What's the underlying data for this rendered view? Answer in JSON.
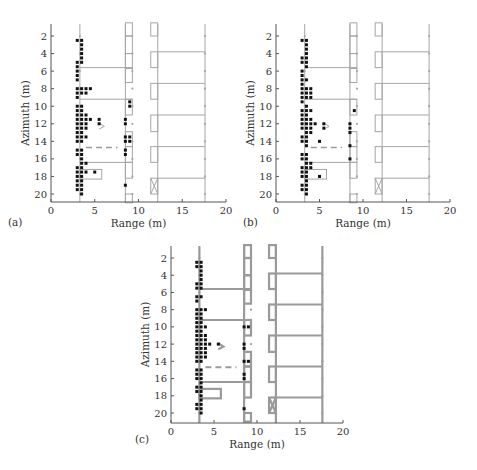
{
  "chart_data": [
    {
      "panel_label": "(a)",
      "type": "scatter",
      "xlabel": "Range (m)",
      "ylabel": "Azimuth (m)",
      "xlim": [
        0,
        20
      ],
      "ylim": [
        21,
        0.5
      ],
      "xticks": [
        0,
        5,
        10,
        15,
        20
      ],
      "yticks": [
        2,
        4,
        6,
        8,
        10,
        12,
        14,
        16,
        18,
        20
      ],
      "grid": false,
      "points": [
        [
          3.0,
          2.5
        ],
        [
          3.5,
          2.5
        ],
        [
          3.5,
          3.0
        ],
        [
          3.5,
          3.5
        ],
        [
          3.5,
          4.0
        ],
        [
          3.5,
          4.5
        ],
        [
          3.5,
          5.0
        ],
        [
          3.0,
          5.0
        ],
        [
          3.0,
          5.5
        ],
        [
          3.0,
          6.0
        ],
        [
          3.0,
          6.5
        ],
        [
          3.0,
          7.0
        ],
        [
          3.0,
          8.0
        ],
        [
          3.5,
          8.0
        ],
        [
          4.0,
          8.0
        ],
        [
          4.5,
          8.0
        ],
        [
          3.0,
          8.5
        ],
        [
          3.5,
          8.5
        ],
        [
          4.0,
          8.5
        ],
        [
          3.0,
          9.0
        ],
        [
          3.0,
          10.0
        ],
        [
          3.5,
          10.0
        ],
        [
          3.0,
          10.5
        ],
        [
          3.5,
          10.5
        ],
        [
          3.0,
          11.0
        ],
        [
          3.5,
          11.0
        ],
        [
          4.0,
          11.0
        ],
        [
          3.0,
          11.5
        ],
        [
          3.5,
          11.5
        ],
        [
          4.0,
          11.5
        ],
        [
          4.5,
          11.5
        ],
        [
          5.5,
          11.5
        ],
        [
          3.0,
          12.0
        ],
        [
          3.5,
          12.0
        ],
        [
          4.0,
          12.0
        ],
        [
          5.5,
          12.0
        ],
        [
          3.0,
          12.5
        ],
        [
          3.5,
          12.5
        ],
        [
          4.0,
          12.5
        ],
        [
          3.0,
          13.0
        ],
        [
          3.5,
          13.0
        ],
        [
          3.0,
          13.5
        ],
        [
          3.5,
          13.5
        ],
        [
          4.0,
          13.5
        ],
        [
          3.0,
          14.0
        ],
        [
          3.5,
          14.0
        ],
        [
          3.0,
          15.0
        ],
        [
          3.5,
          15.0
        ],
        [
          3.0,
          15.5
        ],
        [
          3.5,
          15.5
        ],
        [
          3.5,
          16.0
        ],
        [
          3.5,
          16.5
        ],
        [
          4.0,
          16.5
        ],
        [
          3.0,
          17.0
        ],
        [
          3.5,
          17.0
        ],
        [
          3.0,
          17.5
        ],
        [
          3.5,
          17.5
        ],
        [
          4.0,
          17.5
        ],
        [
          5.0,
          17.5
        ],
        [
          3.0,
          18.0
        ],
        [
          3.5,
          18.0
        ],
        [
          3.0,
          18.5
        ],
        [
          3.5,
          18.5
        ],
        [
          3.0,
          19.0
        ],
        [
          3.5,
          19.0
        ],
        [
          3.0,
          19.5
        ],
        [
          3.5,
          19.5
        ],
        [
          3.5,
          20.0
        ],
        [
          9.0,
          9.5
        ],
        [
          9.0,
          10.0
        ],
        [
          8.5,
          11.5
        ],
        [
          8.5,
          12.0
        ],
        [
          8.5,
          13.5
        ],
        [
          9.0,
          13.5
        ],
        [
          8.5,
          14.0
        ],
        [
          9.0,
          14.0
        ],
        [
          8.5,
          15.0
        ],
        [
          8.5,
          15.5
        ],
        [
          8.5,
          19.0
        ]
      ],
      "annotations": {
        "dashed_line": {
          "x": [
            4.0,
            7.6
          ],
          "y": 14.7
        }
      }
    },
    {
      "panel_label": "(b)",
      "type": "scatter",
      "xlabel": "Range (m)",
      "ylabel": "Azimuth (m)",
      "xlim": [
        0,
        20
      ],
      "ylim": [
        21,
        0.5
      ],
      "xticks": [
        0,
        5,
        10,
        15,
        20
      ],
      "yticks": [
        2,
        4,
        6,
        8,
        10,
        12,
        14,
        16,
        18,
        20
      ],
      "grid": false,
      "points": [
        [
          3.0,
          2.5
        ],
        [
          3.5,
          2.5
        ],
        [
          3.5,
          3.0
        ],
        [
          3.5,
          3.5
        ],
        [
          3.5,
          4.0
        ],
        [
          3.0,
          4.5
        ],
        [
          3.5,
          4.5
        ],
        [
          3.0,
          5.0
        ],
        [
          3.5,
          5.0
        ],
        [
          3.5,
          5.5
        ],
        [
          3.0,
          6.0
        ],
        [
          3.0,
          6.5
        ],
        [
          3.0,
          7.0
        ],
        [
          3.5,
          7.0
        ],
        [
          3.0,
          7.5
        ],
        [
          3.0,
          8.0
        ],
        [
          3.5,
          8.0
        ],
        [
          4.0,
          8.0
        ],
        [
          3.0,
          8.5
        ],
        [
          3.5,
          8.5
        ],
        [
          4.0,
          8.5
        ],
        [
          3.0,
          9.0
        ],
        [
          3.5,
          9.0
        ],
        [
          4.0,
          9.0
        ],
        [
          3.0,
          9.5
        ],
        [
          3.5,
          10.0
        ],
        [
          3.0,
          10.5
        ],
        [
          3.5,
          10.5
        ],
        [
          4.0,
          10.5
        ],
        [
          3.0,
          11.0
        ],
        [
          3.5,
          11.0
        ],
        [
          3.0,
          11.5
        ],
        [
          3.5,
          11.5
        ],
        [
          4.0,
          11.5
        ],
        [
          3.0,
          12.0
        ],
        [
          3.5,
          12.0
        ],
        [
          4.0,
          12.0
        ],
        [
          4.5,
          12.0
        ],
        [
          5.5,
          12.0
        ],
        [
          3.0,
          12.5
        ],
        [
          3.5,
          12.5
        ],
        [
          4.0,
          12.5
        ],
        [
          5.5,
          12.5
        ],
        [
          3.5,
          13.0
        ],
        [
          4.0,
          13.0
        ],
        [
          3.0,
          13.5
        ],
        [
          3.5,
          13.5
        ],
        [
          3.0,
          14.0
        ],
        [
          3.5,
          14.0
        ],
        [
          5.0,
          14.0
        ],
        [
          3.5,
          14.5
        ],
        [
          3.0,
          15.5
        ],
        [
          3.5,
          15.5
        ],
        [
          3.0,
          16.0
        ],
        [
          3.5,
          16.0
        ],
        [
          3.5,
          16.5
        ],
        [
          4.0,
          16.5
        ],
        [
          3.0,
          17.0
        ],
        [
          3.5,
          17.0
        ],
        [
          4.0,
          17.0
        ],
        [
          3.0,
          17.5
        ],
        [
          3.5,
          17.5
        ],
        [
          3.0,
          18.0
        ],
        [
          3.5,
          18.0
        ],
        [
          5.0,
          18.0
        ],
        [
          3.5,
          18.5
        ],
        [
          3.0,
          19.0
        ],
        [
          3.5,
          19.0
        ],
        [
          3.0,
          19.5
        ],
        [
          3.5,
          19.5
        ],
        [
          3.5,
          20.0
        ],
        [
          9.0,
          10.5
        ],
        [
          8.5,
          12.0
        ],
        [
          8.5,
          12.5
        ],
        [
          8.5,
          13.0
        ],
        [
          8.5,
          14.5
        ],
        [
          8.5,
          16.0
        ]
      ],
      "annotations": {
        "dashed_line": {
          "x": [
            4.0,
            7.6
          ],
          "y": 14.7
        }
      }
    },
    {
      "panel_label": "(c)",
      "type": "scatter",
      "xlabel": "Range (m)",
      "ylabel": "Azimuth (m)",
      "xlim": [
        0,
        20
      ],
      "ylim": [
        21,
        0.5
      ],
      "xticks": [
        0,
        5,
        10,
        15,
        20
      ],
      "yticks": [
        2,
        4,
        6,
        8,
        10,
        12,
        14,
        16,
        18,
        20
      ],
      "grid": false,
      "points": [
        [
          3.0,
          2.5
        ],
        [
          3.5,
          2.5
        ],
        [
          3.0,
          3.0
        ],
        [
          3.5,
          3.0
        ],
        [
          3.5,
          3.5
        ],
        [
          3.5,
          4.0
        ],
        [
          3.5,
          4.5
        ],
        [
          3.0,
          5.0
        ],
        [
          3.5,
          5.0
        ],
        [
          3.0,
          5.5
        ],
        [
          3.5,
          5.5
        ],
        [
          3.0,
          6.5
        ],
        [
          3.5,
          6.5
        ],
        [
          3.0,
          7.0
        ],
        [
          3.0,
          8.0
        ],
        [
          3.5,
          8.0
        ],
        [
          4.0,
          8.0
        ],
        [
          3.0,
          8.5
        ],
        [
          3.5,
          8.5
        ],
        [
          3.0,
          9.0
        ],
        [
          3.5,
          9.0
        ],
        [
          3.0,
          9.5
        ],
        [
          3.5,
          9.5
        ],
        [
          3.0,
          10.0
        ],
        [
          3.5,
          10.0
        ],
        [
          4.0,
          10.0
        ],
        [
          3.0,
          10.5
        ],
        [
          3.5,
          10.5
        ],
        [
          3.0,
          11.0
        ],
        [
          3.5,
          11.0
        ],
        [
          4.0,
          11.0
        ],
        [
          3.0,
          11.5
        ],
        [
          3.5,
          11.5
        ],
        [
          4.0,
          11.5
        ],
        [
          3.0,
          12.0
        ],
        [
          3.5,
          12.0
        ],
        [
          4.0,
          12.0
        ],
        [
          4.5,
          12.0
        ],
        [
          5.5,
          12.0
        ],
        [
          3.0,
          12.5
        ],
        [
          3.5,
          12.5
        ],
        [
          4.0,
          12.5
        ],
        [
          3.0,
          13.0
        ],
        [
          3.5,
          13.0
        ],
        [
          4.0,
          13.0
        ],
        [
          3.0,
          13.5
        ],
        [
          3.5,
          13.5
        ],
        [
          4.0,
          13.5
        ],
        [
          3.0,
          14.0
        ],
        [
          3.5,
          14.0
        ],
        [
          3.0,
          15.0
        ],
        [
          3.5,
          15.0
        ],
        [
          3.0,
          15.5
        ],
        [
          3.5,
          15.5
        ],
        [
          3.0,
          16.0
        ],
        [
          3.5,
          16.0
        ],
        [
          3.5,
          16.5
        ],
        [
          3.0,
          17.0
        ],
        [
          3.5,
          17.0
        ],
        [
          3.0,
          17.5
        ],
        [
          3.5,
          17.5
        ],
        [
          3.5,
          18.0
        ],
        [
          3.5,
          18.5
        ],
        [
          3.0,
          19.0
        ],
        [
          3.5,
          19.0
        ],
        [
          3.0,
          19.5
        ],
        [
          3.5,
          19.5
        ],
        [
          3.5,
          20.0
        ],
        [
          8.5,
          10.0
        ],
        [
          9.0,
          10.0
        ],
        [
          8.5,
          12.0
        ],
        [
          8.5,
          12.5
        ],
        [
          8.5,
          14.0
        ],
        [
          9.0,
          14.0
        ],
        [
          8.5,
          15.5
        ],
        [
          8.5,
          16.0
        ],
        [
          8.5,
          19.5
        ]
      ],
      "annotations": {
        "dashed_line": {
          "x": [
            4.0,
            7.6
          ],
          "y": 14.7
        }
      }
    }
  ],
  "figure": {
    "panels": [
      {
        "label": "(a)",
        "x0": 51,
        "x1": 226,
        "yTop": 24,
        "yAxis": 202,
        "yAz2": 36,
        "yAz20": 194,
        "labelX": 8,
        "labelY": 226,
        "line": "thin"
      },
      {
        "label": "(b)",
        "x0": 276,
        "x1": 450,
        "yTop": 24,
        "yAxis": 202,
        "yAz2": 36,
        "yAz20": 194,
        "labelX": 243,
        "labelY": 226,
        "line": "thin"
      },
      {
        "label": "(c)",
        "x0": 171,
        "x1": 343,
        "yTop": 246,
        "yAxis": 423,
        "yAz2": 258,
        "yAz20": 413,
        "labelX": 135,
        "labelY": 443,
        "line": "thick"
      }
    ],
    "colors": {
      "points": "#111111",
      "structure": "#a6a6a6",
      "structure_thick": "#9a9a9a",
      "axis": "#555555",
      "text": "#333333",
      "dashed": "#9a9a9a"
    }
  }
}
